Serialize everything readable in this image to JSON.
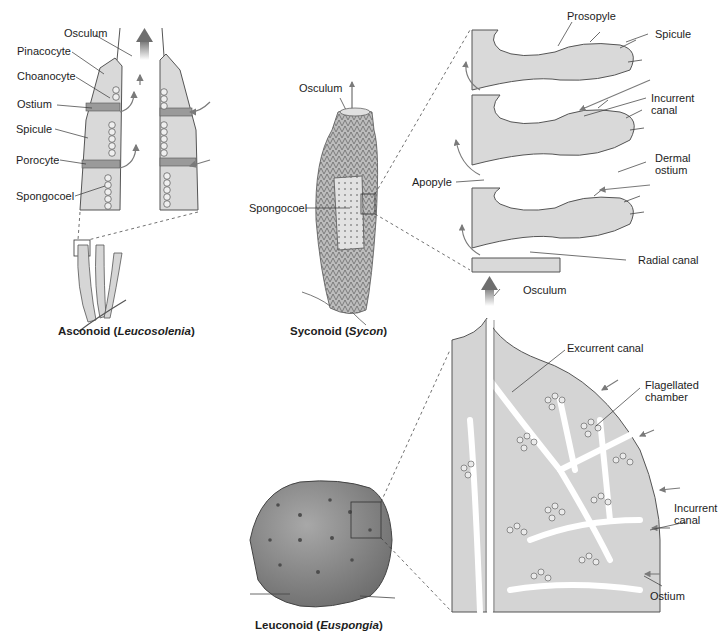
{
  "figure": {
    "panels": {
      "asconoid": {
        "caption_prefix": "Asconoid (",
        "caption_genus": "Leucosolenia",
        "caption_suffix": ")",
        "labels": [
          "Osculum",
          "Pinacocyte",
          "Choanocyte",
          "Ostium",
          "Spicule",
          "Porocyte",
          "Spongocoel"
        ]
      },
      "syconoid": {
        "caption_prefix": "Syconoid (",
        "caption_genus": "Sycon",
        "caption_suffix": ")",
        "labels": [
          "Osculum",
          "Spongocoel"
        ],
        "detail_labels": [
          "Prosopyle",
          "Spicule",
          "Incurrent canal",
          "Dermal ostium",
          "Apopyle",
          "Radial canal"
        ]
      },
      "leuconoid": {
        "caption_prefix": "Leuconoid (",
        "caption_genus": "Euspongia",
        "caption_suffix": ")",
        "detail_labels": [
          "Osculum",
          "Excurrent canal",
          "Flagellated chamber",
          "Incurrent canal",
          "Ostium"
        ]
      }
    },
    "labels": {
      "asc_osculum": "Osculum",
      "asc_pinacocyte": "Pinacocyte",
      "asc_choanocyte": "Choanocyte",
      "asc_ostium": "Ostium",
      "asc_spicule": "Spicule",
      "asc_porocyte": "Porocyte",
      "asc_spongocoel": "Spongocoel",
      "syc_osculum": "Osculum",
      "syc_spongocoel": "Spongocoel",
      "syc_prosopyle": "Prosopyle",
      "syc_spicule": "Spicule",
      "syc_incurrent_1": "Incurrent",
      "syc_incurrent_2": "canal",
      "syc_dermal_1": "Dermal",
      "syc_dermal_2": "ostium",
      "syc_apopyle": "Apopyle",
      "syc_radial": "Radial canal",
      "leu_osculum": "Osculum",
      "leu_excurrent": "Excurrent canal",
      "leu_flag_1": "Flagellated",
      "leu_flag_2": "chamber",
      "leu_incurrent_1": "Incurrent",
      "leu_incurrent_2": "canal",
      "leu_ostium": "Ostium"
    },
    "colors": {
      "tissue": "#d9d9d9",
      "tissue_dark": "#9a9a9a",
      "outline": "#555555",
      "arrow": "#7a7a7a",
      "sponge_body": "#8c8c8c"
    }
  }
}
